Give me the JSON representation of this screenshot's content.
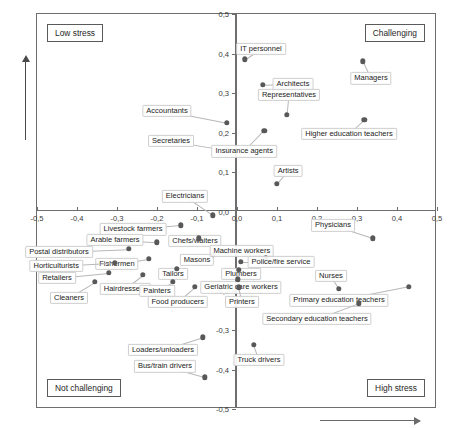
{
  "chart": {
    "type": "scatter",
    "ylabel": "Aggregate of autonomy of time, social support from colleagues and management",
    "xlabel": "",
    "quadrants": {
      "top_left": "Low stress",
      "top_right": "Challenging",
      "bottom_left": "Not challenging",
      "bottom_right": "High stress"
    },
    "xticks": [
      "-0,5",
      "-0,4",
      "-0,3",
      "-0,2",
      "-0,1",
      "0,0",
      "0,1",
      "0,2",
      "0,3",
      "0,4",
      "0,5"
    ],
    "yticks": [
      "0,5",
      "0,4",
      "0,3",
      "0,2",
      "0,1",
      "0,0",
      "-0,1",
      "-0,2",
      "-0,3",
      "-0,4",
      "-0,5"
    ],
    "point_color": "#585858",
    "axis_color": "#6e6e6e"
  },
  "chart_data": {
    "type": "scatter",
    "title": "",
    "xlabel": "",
    "ylabel": "Aggregate of autonomy of time, social support from colleagues and management",
    "xlim": [
      -0.5,
      0.5
    ],
    "ylim": [
      -0.5,
      0.5
    ],
    "grid": false,
    "legend": null,
    "annotations": [
      "Low stress",
      "Challenging",
      "Not challenging",
      "High stress"
    ],
    "points": [
      {
        "label": "Accountants",
        "x": -0.025,
        "y": 0.225,
        "lx": -0.175,
        "ly": 0.255
      },
      {
        "label": "Secretaries",
        "x": -0.025,
        "y": 0.155,
        "lx": -0.165,
        "ly": 0.178
      },
      {
        "label": "Electricians",
        "x": -0.06,
        "y": -0.01,
        "lx": -0.13,
        "ly": 0.038
      },
      {
        "label": "IT personnel",
        "x": 0.02,
        "y": 0.385,
        "lx": 0.06,
        "ly": 0.412
      },
      {
        "label": "Architects",
        "x": 0.065,
        "y": 0.32,
        "lx": 0.14,
        "ly": 0.322
      },
      {
        "label": "Representatives",
        "x": 0.125,
        "y": 0.245,
        "lx": 0.13,
        "ly": 0.295
      },
      {
        "label": "Managers",
        "x": 0.315,
        "y": 0.38,
        "lx": 0.335,
        "ly": 0.337
      },
      {
        "label": "Higher education teachers",
        "x": 0.318,
        "y": 0.232,
        "lx": 0.28,
        "ly": 0.196
      },
      {
        "label": "Insurance agents",
        "x": 0.068,
        "y": 0.205,
        "lx": 0.018,
        "ly": 0.152
      },
      {
        "label": "Artists",
        "x": 0.1,
        "y": 0.07,
        "lx": 0.128,
        "ly": 0.103
      },
      {
        "label": "Livestock farmers",
        "x": -0.14,
        "y": -0.035,
        "lx": -0.26,
        "ly": -0.045
      },
      {
        "label": "Chefs/waiters",
        "x": -0.095,
        "y": -0.068,
        "lx": -0.105,
        "ly": -0.075
      },
      {
        "label": "Arable farmers",
        "x": -0.2,
        "y": -0.078,
        "lx": -0.305,
        "ly": -0.072
      },
      {
        "label": "Postal distributors",
        "x": -0.27,
        "y": -0.095,
        "lx": -0.445,
        "ly": -0.102
      },
      {
        "label": "Masons",
        "x": -0.06,
        "y": -0.11,
        "lx": -0.1,
        "ly": -0.122
      },
      {
        "label": "Fishermen",
        "x": -0.22,
        "y": -0.12,
        "lx": -0.3,
        "ly": -0.133
      },
      {
        "label": "Horticulturists",
        "x": -0.305,
        "y": -0.13,
        "lx": -0.452,
        "ly": -0.138
      },
      {
        "label": "Tailors",
        "x": -0.15,
        "y": -0.145,
        "lx": -0.16,
        "ly": -0.158
      },
      {
        "label": "Retailers",
        "x": -0.32,
        "y": -0.155,
        "lx": -0.45,
        "ly": -0.168
      },
      {
        "label": "Hairdressers",
        "x": -0.235,
        "y": -0.16,
        "lx": -0.28,
        "ly": -0.195
      },
      {
        "label": "Painters",
        "x": -0.16,
        "y": -0.178,
        "lx": -0.2,
        "ly": -0.2
      },
      {
        "label": "Cleaners",
        "x": -0.355,
        "y": -0.178,
        "lx": -0.42,
        "ly": -0.218
      },
      {
        "label": "Food producers",
        "x": -0.105,
        "y": -0.19,
        "lx": -0.148,
        "ly": -0.228
      },
      {
        "label": "Loaders/unloaders",
        "x": -0.085,
        "y": -0.318,
        "lx": -0.185,
        "ly": -0.35
      },
      {
        "label": "Bus/train drivers",
        "x": -0.08,
        "y": -0.42,
        "lx": -0.18,
        "ly": -0.392
      },
      {
        "label": "Physicians",
        "x": 0.34,
        "y": -0.068,
        "lx": 0.24,
        "ly": -0.035
      },
      {
        "label": "Machine workers",
        "x": 0.072,
        "y": -0.118,
        "lx": 0.012,
        "ly": -0.1
      },
      {
        "label": "Police/fire service",
        "x": 0.01,
        "y": -0.128,
        "lx": 0.11,
        "ly": -0.128
      },
      {
        "label": "Plumbers",
        "x": 0.005,
        "y": -0.148,
        "lx": 0.01,
        "ly": -0.157
      },
      {
        "label": "Nurses",
        "x": 0.255,
        "y": -0.195,
        "lx": 0.235,
        "ly": -0.163
      },
      {
        "label": "Geriatric care workers",
        "x": 0.002,
        "y": -0.172,
        "lx": 0.01,
        "ly": -0.192
      },
      {
        "label": "Primary education teachers",
        "x": 0.43,
        "y": -0.19,
        "lx": 0.255,
        "ly": -0.225
      },
      {
        "label": "Printers",
        "x": 0.004,
        "y": -0.192,
        "lx": 0.012,
        "ly": -0.228
      },
      {
        "label": "Secondary education teachers",
        "x": 0.305,
        "y": -0.232,
        "lx": 0.2,
        "ly": -0.272
      },
      {
        "label": "Truck drivers",
        "x": 0.042,
        "y": -0.338,
        "lx": 0.055,
        "ly": -0.375
      }
    ]
  }
}
